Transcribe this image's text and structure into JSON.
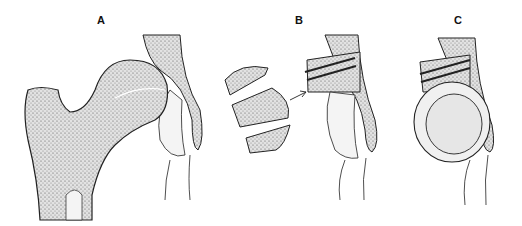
{
  "figure": {
    "panels": [
      {
        "label": "A",
        "description": "Proximal femur and hip joint, femoral head in acetabulum"
      },
      {
        "label": "B",
        "description": "Bone graft fragments transferred and fixed with screws above acetabulum"
      },
      {
        "label": "C",
        "description": "Acetabular component placed beneath screw-fixed graft"
      }
    ]
  },
  "colors": {
    "outline": "#222222",
    "bone_fill": "#d6d6d6",
    "background": "#ffffff"
  }
}
